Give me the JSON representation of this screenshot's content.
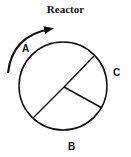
{
  "title": "Reactor",
  "diagram": {
    "type": "rotating-reactor-sectors",
    "rotation_direction": "clockwise",
    "sector_count": 3,
    "labels": {
      "a": "A",
      "b": "B",
      "c": "C"
    },
    "stroke_color": "#111111",
    "background_color": "#ffffff"
  }
}
